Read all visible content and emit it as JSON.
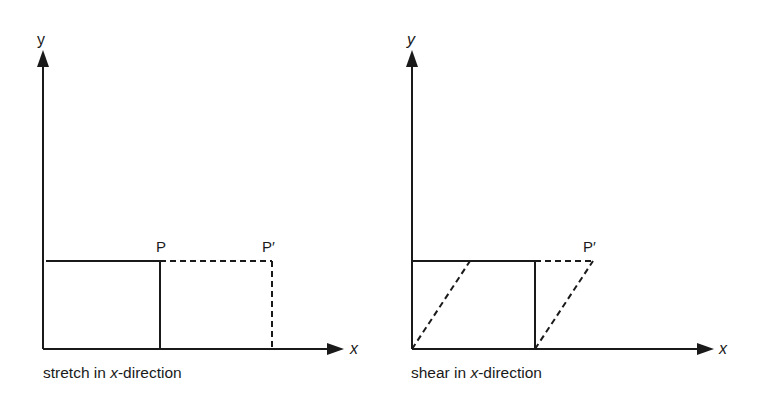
{
  "diagrams": [
    {
      "caption_prefix": "stretch in ",
      "caption_var": "x",
      "caption_suffix": "-direction",
      "axis_x_label": "x",
      "axis_y_label": "y",
      "point_label": "P",
      "image_label": "P′"
    },
    {
      "caption_prefix": "shear in ",
      "caption_var": "x",
      "caption_suffix": "-direction",
      "axis_x_label": "x",
      "axis_y_label": "y",
      "image_label": "P′"
    }
  ],
  "colors": {
    "line": "#1a1a1a",
    "background": "#ffffff"
  }
}
